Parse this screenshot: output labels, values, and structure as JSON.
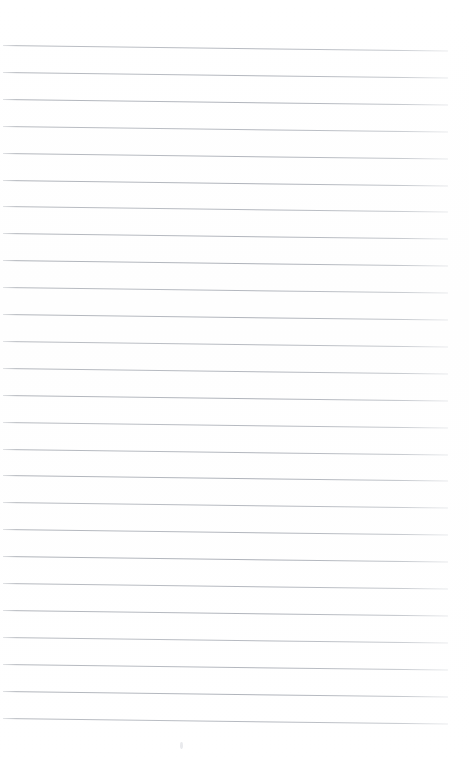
{
  "document": {
    "kind": "scanned-ruled-paper",
    "title": "Blank ruled notebook page",
    "page_width": 469,
    "page_height": 764,
    "background_color": "#ffffff",
    "rule_color": "#b0b4bb",
    "rule_thickness_px": 1,
    "written_content": "",
    "has_handwriting": false,
    "has_margin_rule": false,
    "has_header": false,
    "has_page_number": false
  },
  "ruling": {
    "line_count": 26,
    "line_spacing_px": 26.9,
    "first_line_y": 45,
    "last_line_y": 718,
    "left_x": 3,
    "right_x": 448,
    "line_length_px": 445,
    "skew_degrees": 0.72,
    "top_margin_px": 45,
    "bottom_margin_px": 42,
    "right_margin_px": 21,
    "left_margin_px": 3,
    "line_tops": [
      45.0,
      71.9,
      98.8,
      125.7,
      152.6,
      179.5,
      206.4,
      233.3,
      260.2,
      287.1,
      314.0,
      340.9,
      367.8,
      394.7,
      421.6,
      448.5,
      475.4,
      502.3,
      529.2,
      556.1,
      583.0,
      609.9,
      636.8,
      663.7,
      690.6,
      717.5
    ]
  },
  "artifacts": {
    "specks": [
      {
        "x": 180,
        "y": 742,
        "name": "scan-speck"
      }
    ]
  }
}
